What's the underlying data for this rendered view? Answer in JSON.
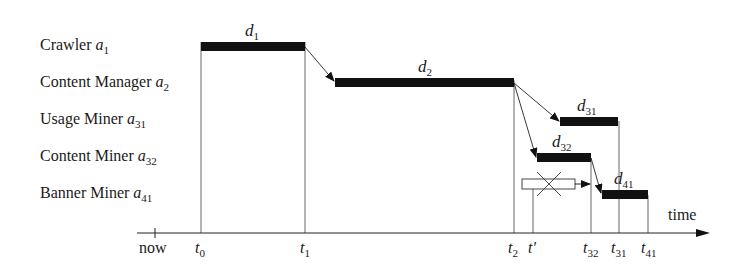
{
  "agents": [
    {
      "name": "Crawler",
      "symbol": "a",
      "sub": "1"
    },
    {
      "name": "Content Manager",
      "symbol": "a",
      "sub": "2"
    },
    {
      "name": "Usage Miner",
      "symbol": "a",
      "sub": "31"
    },
    {
      "name": "Content Miner",
      "symbol": "a",
      "sub": "32"
    },
    {
      "name": "Banner Miner",
      "symbol": "a",
      "sub": "41"
    }
  ],
  "durations": [
    {
      "symbol": "d",
      "sub": "1"
    },
    {
      "symbol": "d",
      "sub": "2"
    },
    {
      "symbol": "d",
      "sub": "31"
    },
    {
      "symbol": "d",
      "sub": "32"
    },
    {
      "symbol": "d",
      "sub": "41"
    }
  ],
  "axis": {
    "label": "time",
    "now_label": "now",
    "ticks": [
      {
        "symbol": "t",
        "sub": "0"
      },
      {
        "symbol": "t",
        "sub": "1"
      },
      {
        "symbol": "t",
        "sub": "2"
      },
      {
        "symbol": "t",
        "sub": "′"
      },
      {
        "symbol": "t",
        "sub": "32"
      },
      {
        "symbol": "t",
        "sub": "31"
      },
      {
        "symbol": "t",
        "sub": "41"
      }
    ]
  },
  "colors": {
    "bar": "#111111",
    "line": "#333333"
  }
}
